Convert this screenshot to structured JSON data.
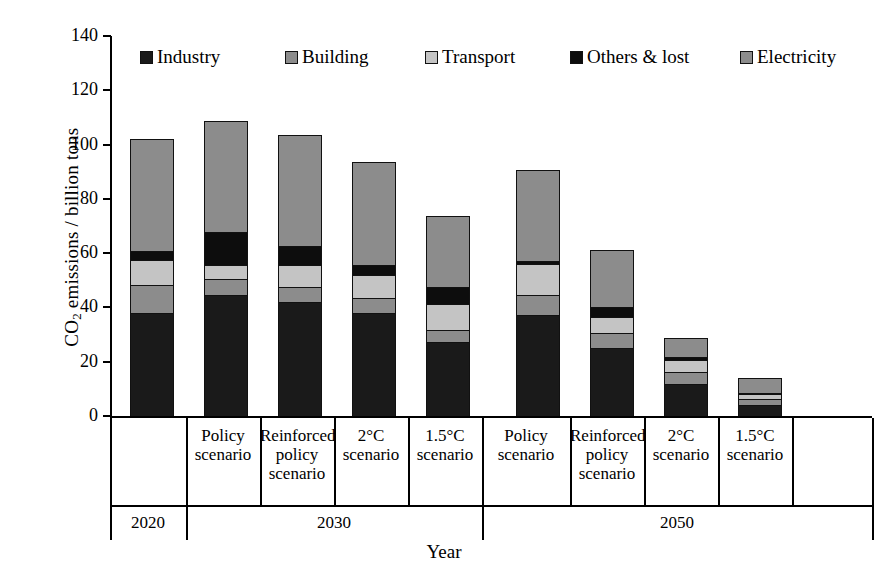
{
  "chart_data": {
    "type": "bar",
    "subtype": "stacked",
    "title": "",
    "xlabel": "Year",
    "ylabel": "CO2 emissions / billion tons",
    "ylabel_html": "CO<sub>2</sub> emissions / billion tons",
    "ylim": [
      0,
      140
    ],
    "yticks": [
      0,
      20,
      40,
      60,
      80,
      100,
      120,
      140
    ],
    "grid": false,
    "legend_position": "top-inside",
    "categories": [
      "2020",
      "Policy scenario",
      "Reinforced policy scenario",
      "2°C scenario",
      "1.5°C scenario",
      "Policy scenario",
      "Reinforced policy scenario",
      "2°C scenario",
      "1.5°C scenario"
    ],
    "groups": [
      {
        "label": "2020",
        "count": 1
      },
      {
        "label": "2030",
        "count": 4
      },
      {
        "label": "2050",
        "count": 4
      }
    ],
    "series": [
      {
        "name": "Industry",
        "color": "#1a1a1a",
        "values": [
          38.5,
          45.0,
          42.5,
          38.5,
          27.5,
          37.5,
          25.5,
          12.0,
          4.5
        ]
      },
      {
        "name": "Building",
        "color": "#8c8c8c",
        "values": [
          10.0,
          6.0,
          5.5,
          5.5,
          4.5,
          7.5,
          5.5,
          4.5,
          2.0
        ]
      },
      {
        "name": "Transport",
        "color": "#c4c4c4",
        "values": [
          9.5,
          5.0,
          8.0,
          8.5,
          9.5,
          11.5,
          6.0,
          4.5,
          2.0
        ]
      },
      {
        "name": "Others & lost",
        "color": "#0d0d0d",
        "values": [
          3.0,
          12.0,
          7.0,
          3.5,
          6.5,
          1.0,
          3.5,
          1.0,
          0.5
        ]
      },
      {
        "name": "Electricity",
        "color": "#8c8c8c",
        "values": [
          41.5,
          41.0,
          41.0,
          38.0,
          26.0,
          33.5,
          21.0,
          7.0,
          5.5
        ]
      }
    ],
    "totals": [
      102.5,
      109.0,
      104.0,
      94.0,
      74.0,
      91.0,
      61.5,
      29.0,
      14.5
    ]
  },
  "legend": {
    "items": [
      {
        "label": "Industry",
        "swatch": "legend-swatch-industry"
      },
      {
        "label": "Building",
        "swatch": "legend-swatch-building"
      },
      {
        "label": "Transport",
        "swatch": "legend-swatch-transport"
      },
      {
        "label": "Others & lost",
        "swatch": "legend-swatch-others"
      },
      {
        "label": "Electricity",
        "swatch": "legend-swatch-electricity"
      }
    ]
  },
  "axes": {
    "y_title_main": "CO",
    "y_title_sub": "2",
    "y_title_rest": " emissions / billion tons",
    "x_title": "Year",
    "y_tick_labels": [
      "140",
      "120",
      "100",
      "80",
      "60",
      "40",
      "20",
      "0"
    ]
  },
  "x_labels": {
    "tier1": [
      {
        "line1": "",
        "line2": "",
        "line3": ""
      },
      {
        "line1": "Policy",
        "line2": "scenario",
        "line3": ""
      },
      {
        "line1": "Reinforced",
        "line2": "policy",
        "line3": "scenario"
      },
      {
        "line1": "2°C",
        "line2": "scenario",
        "line3": ""
      },
      {
        "line1": "1.5°C",
        "line2": "scenario",
        "line3": ""
      },
      {
        "line1": "Policy",
        "line2": "scenario",
        "line3": ""
      },
      {
        "line1": "Reinforced",
        "line2": "policy",
        "line3": "scenario"
      },
      {
        "line1": "2°C",
        "line2": "scenario",
        "line3": ""
      },
      {
        "line1": "1.5°C",
        "line2": "scenario",
        "line3": ""
      }
    ],
    "tier2": [
      "2020",
      "2030",
      "2050"
    ]
  },
  "colors": {
    "industry": "#1a1a1a",
    "building": "#8c8c8c",
    "transport": "#c4c4c4",
    "others": "#0d0d0d",
    "electricity": "#8c8c8c",
    "axis": "#000000",
    "background": "#ffffff"
  }
}
